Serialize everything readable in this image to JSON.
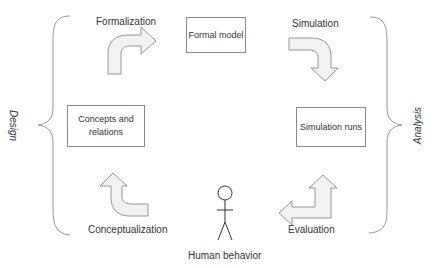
{
  "diagram": {
    "type": "cycle",
    "side_labels": {
      "left": "Design",
      "right": "Analysis"
    },
    "boxes": {
      "formal_model": "Formal model",
      "concepts": "Concepts and relations",
      "simulation_runs": "Simulation runs"
    },
    "steps": {
      "formalization": "Formalization",
      "simulation": "Simulation",
      "evaluation": "Evaluation",
      "conceptualization": "Conceptualization"
    },
    "actor": {
      "label": "Human behavior",
      "icon": "stick-figure-icon"
    },
    "colors": {
      "stroke": "#8a8a8a",
      "arrow_fill": "#f2f2f2",
      "text": "#333333"
    }
  }
}
